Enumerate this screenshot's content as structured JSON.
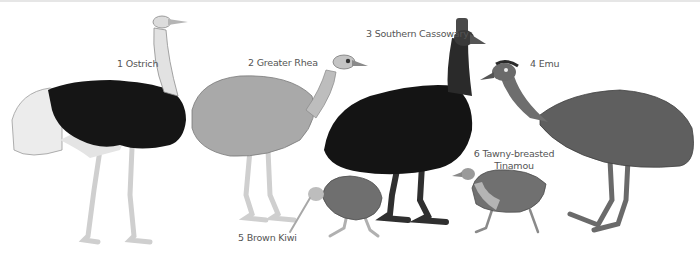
{
  "figure": {
    "birds": [
      {
        "number": "1",
        "name": "Ostrich",
        "label": "1 Ostrich"
      },
      {
        "number": "2",
        "name": "Greater Rhea",
        "label": "2 Greater Rhea"
      },
      {
        "number": "3",
        "name": "Southern Cassowary",
        "label": "3 Southern Cassowary"
      },
      {
        "number": "4",
        "name": "Emu",
        "label": "4 Emu"
      },
      {
        "number": "5",
        "name": "Brown Kiwi",
        "label": "5 Brown Kiwi"
      },
      {
        "number": "6",
        "name": "Tawny-breasted Tinamou",
        "label_line1": "6 Tawny-breasted",
        "label_line2": "Tinamou"
      }
    ]
  },
  "colors": {
    "background": "#ffffff",
    "label_text": "#555555",
    "ostrich_body": "#151515",
    "ostrich_plumes": "#e8e8e8",
    "rhea_body": "#a9a9a9",
    "cassowary_body": "#141414",
    "emu_body": "#5f5f5f",
    "kiwi_body": "#6f6f6f",
    "tinamou_body": "#707070",
    "legs_light": "#d8d8d8",
    "legs_dark": "#3a3a3a"
  }
}
